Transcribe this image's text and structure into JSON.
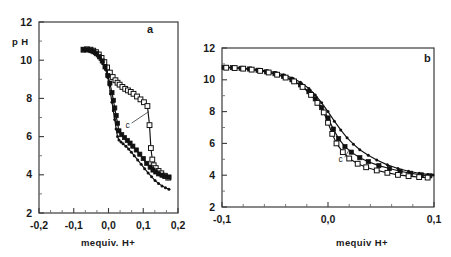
{
  "figure": {
    "cut_caption_fragment": "· ·    ·",
    "panels": [
      {
        "id": "a",
        "label": "a",
        "x_axis": {
          "title": "mequiv.  H+",
          "ticks": [
            "-0,2",
            "-0,1",
            "0,0",
            "0,1",
            "0,2"
          ],
          "min": -0.2,
          "max": 0.2
        },
        "y_axis": {
          "title": "p H",
          "ticks": [
            "12",
            "10",
            "8",
            "6",
            "4",
            "2"
          ],
          "min": 2,
          "max": 12
        },
        "annotation": {
          "text": "c",
          "target_series": "open-square"
        }
      },
      {
        "id": "b",
        "label": "b",
        "x_axis": {
          "title": "mequiv  H+",
          "ticks": [
            "-0,1",
            "0,0",
            "0,1"
          ],
          "min": -0.1,
          "max": 0.1
        },
        "y_axis": {
          "title": "",
          "ticks": [
            "12",
            "10",
            "8",
            "6",
            "4",
            "2"
          ],
          "min": 2,
          "max": 12
        },
        "annotation": {
          "text": "c",
          "target_series": "open-square"
        }
      }
    ]
  },
  "chart_data": [
    {
      "type": "line",
      "title": "a",
      "xlabel": "mequiv.  H+",
      "ylabel": "p H",
      "xlim": [
        -0.2,
        0.2
      ],
      "ylim": [
        2,
        12
      ],
      "grid": false,
      "legend": "none",
      "annotations": [
        {
          "text": "c",
          "x": 0.055,
          "y": 6.6
        }
      ],
      "series": [
        {
          "name": "open-square",
          "marker": "open-square",
          "x": [
            -0.072,
            -0.062,
            -0.052,
            -0.044,
            -0.036,
            -0.028,
            -0.02,
            -0.012,
            -0.004,
            0.004,
            0.012,
            0.02,
            0.026,
            0.032,
            0.04,
            0.048,
            0.056,
            0.064,
            0.072,
            0.082,
            0.092,
            0.102,
            0.112,
            0.118,
            0.122,
            0.126,
            0.13,
            0.136,
            0.144,
            0.152,
            0.162,
            0.172
          ],
          "y": [
            10.55,
            10.57,
            10.55,
            10.5,
            10.42,
            10.3,
            10.12,
            9.9,
            9.62,
            9.35,
            9.12,
            8.95,
            8.82,
            8.72,
            8.6,
            8.5,
            8.42,
            8.34,
            8.24,
            8.1,
            7.95,
            7.8,
            7.6,
            6.6,
            5.4,
            4.8,
            4.5,
            4.35,
            4.2,
            4.08,
            3.95,
            3.85
          ]
        },
        {
          "name": "filled-square",
          "marker": "filled-square",
          "x": [
            -0.072,
            -0.06,
            -0.05,
            -0.042,
            -0.034,
            -0.026,
            -0.018,
            -0.01,
            -0.002,
            0.004,
            0.01,
            0.014,
            0.018,
            0.022,
            0.026,
            0.03,
            0.038,
            0.046,
            0.054,
            0.062,
            0.07,
            0.08,
            0.09,
            0.1,
            0.11,
            0.12,
            0.128,
            0.136,
            0.144,
            0.154,
            0.164,
            0.174
          ],
          "y": [
            10.55,
            10.55,
            10.5,
            10.44,
            10.34,
            10.18,
            9.96,
            9.65,
            9.2,
            8.8,
            8.3,
            7.9,
            7.5,
            7.1,
            6.7,
            6.3,
            6.1,
            5.95,
            5.8,
            5.66,
            5.5,
            5.3,
            5.08,
            4.85,
            4.6,
            4.4,
            4.25,
            4.15,
            4.05,
            3.98,
            3.92,
            3.88
          ]
        },
        {
          "name": "small-dot",
          "marker": "small-dot",
          "x": [
            -0.07,
            -0.058,
            -0.048,
            -0.04,
            -0.032,
            -0.024,
            -0.016,
            -0.008,
            -0.002,
            0.002,
            0.006,
            0.01,
            0.014,
            0.018,
            0.022,
            0.026,
            0.03,
            0.036,
            0.042,
            0.05,
            0.058,
            0.066,
            0.074,
            0.084,
            0.094,
            0.104,
            0.114,
            0.124,
            0.134,
            0.144,
            0.154,
            0.164,
            0.174
          ],
          "y": [
            10.55,
            10.54,
            10.48,
            10.4,
            10.28,
            10.1,
            9.85,
            9.5,
            9.1,
            8.7,
            8.25,
            7.8,
            7.35,
            6.9,
            6.4,
            6.0,
            5.82,
            5.72,
            5.62,
            5.5,
            5.35,
            5.18,
            5.0,
            4.78,
            4.55,
            4.32,
            4.1,
            3.9,
            3.7,
            3.55,
            3.42,
            3.32,
            3.24
          ]
        }
      ]
    },
    {
      "type": "line",
      "title": "b",
      "xlabel": "mequiv  H+",
      "ylabel": "",
      "xlim": [
        -0.1,
        0.1
      ],
      "ylim": [
        2,
        12
      ],
      "grid": false,
      "legend": "none",
      "annotations": [
        {
          "text": "c",
          "x": 0.012,
          "y": 5.0
        }
      ],
      "series": [
        {
          "name": "small-dot",
          "marker": "small-dot",
          "x": [
            -0.098,
            -0.09,
            -0.082,
            -0.074,
            -0.066,
            -0.058,
            -0.05,
            -0.042,
            -0.034,
            -0.026,
            -0.018,
            -0.012,
            -0.006,
            0.0,
            0.006,
            0.012,
            0.018,
            0.024,
            0.03,
            0.038,
            0.046,
            0.056,
            0.066,
            0.076,
            0.086,
            0.094,
            0.099
          ],
          "y": [
            10.8,
            10.78,
            10.74,
            10.7,
            10.64,
            10.56,
            10.46,
            10.32,
            10.12,
            9.85,
            9.45,
            9.05,
            8.55,
            8.0,
            7.4,
            6.85,
            6.35,
            5.95,
            5.6,
            5.25,
            4.95,
            4.65,
            4.42,
            4.25,
            4.12,
            4.05,
            4.02
          ]
        },
        {
          "name": "filled-square",
          "marker": "filled-square",
          "x": [
            -0.098,
            -0.09,
            -0.082,
            -0.074,
            -0.066,
            -0.058,
            -0.05,
            -0.042,
            -0.034,
            -0.026,
            -0.018,
            -0.012,
            -0.006,
            0.0,
            0.005,
            0.01,
            0.016,
            0.022,
            0.03,
            0.038,
            0.048,
            0.058,
            0.068,
            0.078,
            0.088,
            0.096
          ],
          "y": [
            10.78,
            10.76,
            10.72,
            10.68,
            10.6,
            10.5,
            10.38,
            10.22,
            10.0,
            9.68,
            9.25,
            8.8,
            8.25,
            7.6,
            6.9,
            6.3,
            5.8,
            5.45,
            5.1,
            4.85,
            4.6,
            4.42,
            4.25,
            4.12,
            4.02,
            3.96
          ]
        },
        {
          "name": "open-square",
          "marker": "open-square",
          "x": [
            -0.096,
            -0.088,
            -0.08,
            -0.072,
            -0.064,
            -0.056,
            -0.048,
            -0.04,
            -0.032,
            -0.024,
            -0.016,
            -0.01,
            -0.004,
            0.0,
            0.004,
            0.008,
            0.014,
            0.02,
            0.028,
            0.036,
            0.046,
            0.056,
            0.066,
            0.076,
            0.086,
            0.094
          ],
          "y": [
            10.76,
            10.74,
            10.7,
            10.64,
            10.56,
            10.46,
            10.32,
            10.14,
            9.9,
            9.55,
            9.05,
            8.55,
            7.95,
            7.3,
            6.6,
            6.0,
            5.45,
            5.05,
            4.72,
            4.5,
            4.3,
            4.15,
            4.02,
            3.94,
            3.88,
            3.85
          ]
        }
      ]
    }
  ]
}
